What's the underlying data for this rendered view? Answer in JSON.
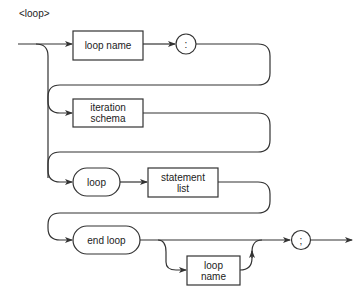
{
  "title": "<loop>",
  "nodes": {
    "loop_name_top": {
      "label": "loop name",
      "shape": "rectangle"
    },
    "colon": {
      "label": ":",
      "shape": "circle"
    },
    "iteration_schema": {
      "label_line1": "iteration",
      "label_line2": "schema",
      "shape": "rectangle"
    },
    "loop_kw": {
      "label": "loop",
      "shape": "rounded"
    },
    "statement_list": {
      "label_line1": "statement",
      "label_line2": "list",
      "shape": "rectangle"
    },
    "end_loop": {
      "label": "end loop",
      "shape": "rounded"
    },
    "loop_name_bottom": {
      "label_line1": "loop",
      "label_line2": "name",
      "shape": "rectangle"
    },
    "semicolon": {
      "label": ";",
      "shape": "circle"
    }
  },
  "colors": {
    "line": "#333333",
    "background": "#ffffff"
  }
}
